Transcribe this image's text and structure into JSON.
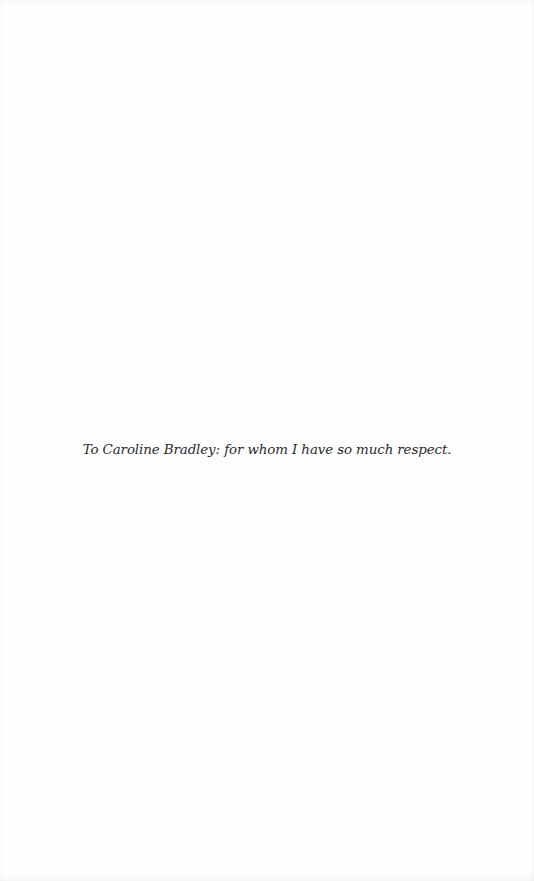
{
  "page": {
    "dedication": "To Caroline Bradley: for whom I have so much respect."
  }
}
